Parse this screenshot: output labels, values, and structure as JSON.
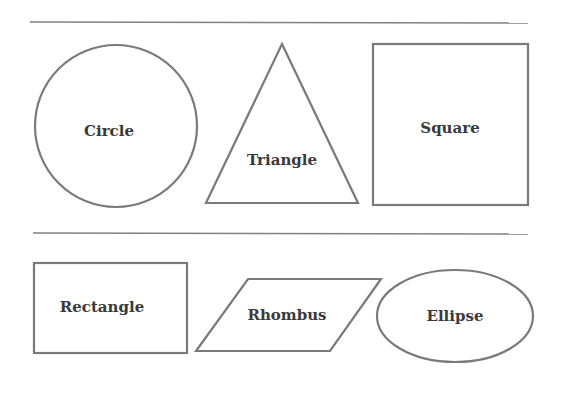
{
  "diagram": {
    "top_rule": {
      "x1": 30,
      "y1": 22,
      "x2": 528,
      "y2": 23
    },
    "middle_rule": {
      "x1": 33,
      "y1": 233,
      "x2": 528,
      "y2": 234
    },
    "shapes": [
      {
        "id": "circle",
        "label": "Circle",
        "label_x": 109,
        "label_y": 136
      },
      {
        "id": "triangle",
        "label": "Triangle",
        "label_x": 282,
        "label_y": 165
      },
      {
        "id": "square",
        "label": "Square",
        "label_x": 450,
        "label_y": 133
      },
      {
        "id": "rectangle",
        "label": "Rectangle",
        "label_x": 102,
        "label_y": 312
      },
      {
        "id": "rhombus",
        "label": "Rhombus",
        "label_x": 287,
        "label_y": 320
      },
      {
        "id": "ellipse",
        "label": "Ellipse",
        "label_x": 455,
        "label_y": 321
      }
    ]
  },
  "colors": {
    "stroke": "#7a7a7a",
    "text": "#3a3a3a",
    "background": "#ffffff"
  }
}
